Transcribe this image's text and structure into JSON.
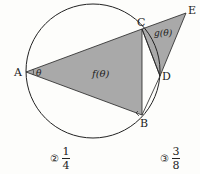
{
  "diagram": {
    "points": {
      "A": {
        "label": "A",
        "x": 26,
        "y": 72
      },
      "B": {
        "label": "B",
        "x": 142,
        "y": 115
      },
      "C": {
        "label": "C",
        "x": 142,
        "y": 29
      },
      "D": {
        "label": "D",
        "x": 160,
        "y": 76
      },
      "E": {
        "label": "E",
        "x": 186,
        "y": 13
      }
    },
    "circle": {
      "cx": 93,
      "cy": 71,
      "r": 67
    },
    "angle_label": "θ",
    "region_f_label": "f(θ)",
    "region_g_label": "g(θ)",
    "fill_color": "#a9a9a9",
    "stroke_color": "#222222"
  },
  "choices": [
    {
      "marker": "②",
      "numerator": "1",
      "denominator": "4"
    },
    {
      "marker": "③",
      "numerator": "3",
      "denominator": "8"
    }
  ]
}
